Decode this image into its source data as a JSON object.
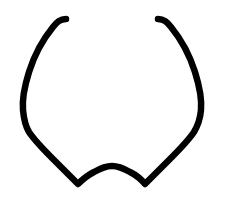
{
  "canvas": {
    "width": 235,
    "height": 199,
    "background_color": "#ffffff",
    "name": "line-drawing-canvas"
  },
  "drawing": {
    "title": "Freehand line drawing",
    "description": "A single black hand-drawn open curve forming two symmetric downward-sweeping arcs that meet in a shallow upward arch at the bottom, with the upper tips curling slightly inward.",
    "stroke_color": "#000000",
    "stroke_width": 6.5,
    "stroke_linecap": "round",
    "stroke_linejoin": "round",
    "fill": "none",
    "path": "M 66 19 C 60 19 57 22 53 27 C 44 38 35 53 29 72 C 24 88 22 99 23 110 C 24 121 26 127 29 132 C 35 141 44 150 53 159 C 62 168 71 177 78 184 C 83 179 88 175 94 172 C 101 168 107 166 112 166 C 117 166 123 168 130 172 C 136 175 141 179 145 184 C 152 177 161 168 170 159 C 179 150 188 141 194 132 C 197 127 200 121 201 110 C 202 99 200 88 195 72 C 189 53 180 38 171 27 C 167 22 164 19 158 19",
    "anchor_points": [
      {
        "name": "left-tip",
        "x": 66,
        "y": 19
      },
      {
        "name": "left-widest",
        "x": 23,
        "y": 107
      },
      {
        "name": "left-shoulder",
        "x": 29,
        "y": 132
      },
      {
        "name": "left-bottom-vertex",
        "x": 78,
        "y": 184
      },
      {
        "name": "center-arch-apex",
        "x": 112,
        "y": 166
      },
      {
        "name": "right-bottom-vertex",
        "x": 145,
        "y": 184
      },
      {
        "name": "right-shoulder",
        "x": 194,
        "y": 132
      },
      {
        "name": "right-widest",
        "x": 201,
        "y": 107
      },
      {
        "name": "right-tip",
        "x": 158,
        "y": 19
      }
    ]
  }
}
